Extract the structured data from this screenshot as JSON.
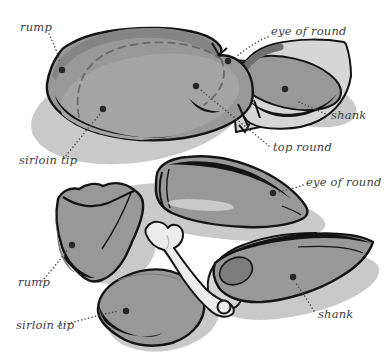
{
  "labels": {
    "rump_top": "rump",
    "eye_of_round_top": "eye of round",
    "shank_top": "shank",
    "top_round": "top round",
    "sirloin_tip_top": "sirloin tip",
    "eye_of_round_middle": "eye of round",
    "rump_bottom": "rump",
    "sirloin_tip_bottom": "sirloin tip",
    "shank_bottom": "shank"
  },
  "colors": {
    "background": "#ffffff",
    "meat": "#989898",
    "meat_dark": "#858585",
    "meat_face": "#a4a4a4",
    "muscle_dark": "#7d7d7d",
    "fat_membrane": "#d6d6d6",
    "bone": "#ececec",
    "shadow": "#c9c9c9",
    "highlight": "#c9c9c9",
    "outline": "#141414",
    "label_text": "#3d3d3d",
    "leader": "#4a4a4a",
    "dot": "#262626"
  }
}
